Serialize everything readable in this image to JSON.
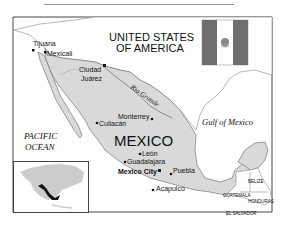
{
  "map": {
    "title": "",
    "countries": {
      "usa": "UNITED STATES OF AMERICA",
      "usa_line1": "UNITED STATES",
      "usa_line2": "OF AMERICA",
      "mexico": "MEXICO",
      "belize": "BELIZE",
      "guatemala": "GUATEMALA",
      "honduras": "HONDURAS",
      "el_salvador": "EL SALVADOR"
    },
    "water": {
      "pacific_line1": "PACIFIC",
      "pacific_line2": "OCEAN",
      "gulf": "Gulf of Mexico",
      "river": "Rio Grande"
    },
    "cities": [
      {
        "name": "Tijuana",
        "type": "city"
      },
      {
        "name": "Mexicali",
        "type": "city"
      },
      {
        "name": "Ciudad",
        "type": "city"
      },
      {
        "name": "Juárez",
        "type": "city"
      },
      {
        "name": "Culiacán",
        "type": "city"
      },
      {
        "name": "Monterrey",
        "type": "city"
      },
      {
        "name": "León",
        "type": "city"
      },
      {
        "name": "Guadalajara",
        "type": "city"
      },
      {
        "name": "Mexico City",
        "type": "capital"
      },
      {
        "name": "Puebla",
        "type": "city"
      },
      {
        "name": "Acapulco",
        "type": "city"
      }
    ],
    "colors": {
      "land_mexico": "#d9d9d9",
      "land_other": "#ffffff",
      "water": "#ffffff",
      "border": "#555555",
      "flag_green": "#6e6e6e",
      "flag_white": "#ffffff",
      "flag_red": "#6e6e6e",
      "inset_land": "#cccccc",
      "inset_mexico": "#111111"
    }
  }
}
